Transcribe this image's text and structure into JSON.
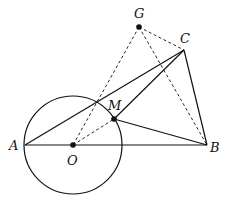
{
  "diagram": {
    "type": "geometry",
    "points": {
      "A": {
        "label": "A",
        "x": 25,
        "y": 145
      },
      "O": {
        "label": "O",
        "x": 73,
        "y": 145
      },
      "B": {
        "label": "B",
        "x": 207,
        "y": 145
      },
      "C": {
        "label": "C",
        "x": 184,
        "y": 50
      },
      "G": {
        "label": "G",
        "x": 139,
        "y": 27
      },
      "M": {
        "label": "M",
        "x": 114,
        "y": 119
      }
    },
    "circle": {
      "center": "O",
      "radius": 49
    },
    "solid_segments": [
      [
        "A",
        "B"
      ],
      [
        "A",
        "C"
      ],
      [
        "C",
        "B"
      ],
      [
        "C",
        "M"
      ],
      [
        "M",
        "B"
      ]
    ],
    "dashed_segments": [
      [
        "G",
        "C"
      ],
      [
        "G",
        "B"
      ],
      [
        "G",
        "O"
      ],
      [
        "O",
        "M"
      ]
    ],
    "filled_points": [
      "G",
      "O",
      "M"
    ],
    "colors": {
      "stroke": "#111111",
      "background": "#ffffff"
    }
  }
}
